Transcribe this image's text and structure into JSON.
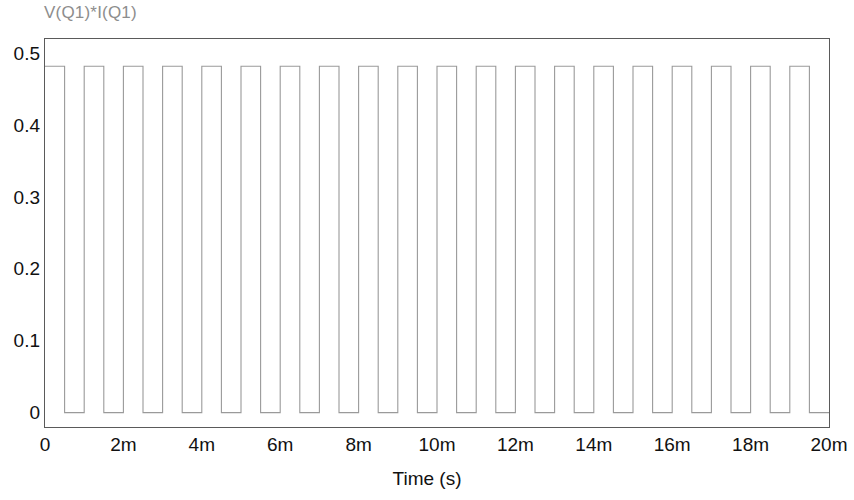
{
  "chart_data": {
    "type": "line",
    "title": "V(Q1)*I(Q1)",
    "xlabel": "Time (s)",
    "ylabel": "",
    "xlim": [
      0,
      0.02
    ],
    "ylim": [
      -0.02,
      0.52
    ],
    "grid": false,
    "legend": null,
    "series": [
      {
        "name": "V(Q1)*I(Q1)",
        "color": "#9a9a9a",
        "waveform": "square",
        "high_value": 0.482,
        "low_value": 0.0,
        "period_s": 0.001,
        "duty_cycle": 0.5,
        "starts_high": true,
        "cycles": 20
      }
    ],
    "x_ticks": [
      {
        "value": 0,
        "label": "0"
      },
      {
        "value": 0.002,
        "label": "2m"
      },
      {
        "value": 0.004,
        "label": "4m"
      },
      {
        "value": 0.006,
        "label": "6m"
      },
      {
        "value": 0.008,
        "label": "8m"
      },
      {
        "value": 0.01,
        "label": "10m"
      },
      {
        "value": 0.012,
        "label": "12m"
      },
      {
        "value": 0.014,
        "label": "14m"
      },
      {
        "value": 0.016,
        "label": "16m"
      },
      {
        "value": 0.018,
        "label": "18m"
      },
      {
        "value": 0.02,
        "label": "20m"
      }
    ],
    "y_ticks": [
      {
        "value": 0.5,
        "label": "0.5"
      },
      {
        "value": 0.4,
        "label": "0.4"
      },
      {
        "value": 0.3,
        "label": "0.3"
      },
      {
        "value": 0.2,
        "label": "0.2"
      },
      {
        "value": 0.1,
        "label": "0.1"
      },
      {
        "value": 0.0,
        "label": "0"
      }
    ],
    "colors": {
      "trace": "#9a9a9a",
      "frame": "#5a5a5a",
      "title": "#8d8d8d",
      "tick_text": "#111111",
      "background": "#ffffff"
    }
  }
}
